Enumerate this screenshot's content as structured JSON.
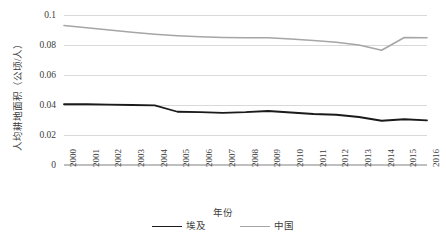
{
  "chart_data": {
    "type": "line",
    "title": "",
    "xlabel": "年份",
    "ylabel": "人均耕地面积（公顷/人）",
    "categories": [
      "2000",
      "2001",
      "2002",
      "2003",
      "2004",
      "2005",
      "2006",
      "2007",
      "2008",
      "2009",
      "2010",
      "2011",
      "2012",
      "2013",
      "2014",
      "2015",
      "2016"
    ],
    "ylim": [
      0,
      0.1
    ],
    "yticks": [
      "0",
      "0.02",
      "0.04",
      "0.06",
      "0.08",
      "0.1"
    ],
    "ytick_values": [
      0,
      0.02,
      0.04,
      0.06,
      0.08,
      0.1
    ],
    "grid": true,
    "legend_position": "bottom",
    "series": [
      {
        "name": "埃及",
        "color": "#1a1a1a",
        "width": 1.8,
        "values": [
          0.0405,
          0.0405,
          0.0402,
          0.04,
          0.0398,
          0.0355,
          0.0352,
          0.0348,
          0.0352,
          0.036,
          0.035,
          0.034,
          0.0335,
          0.032,
          0.0295,
          0.0305,
          0.0298
        ]
      },
      {
        "name": "中国",
        "color": "#a6a6a6",
        "width": 1.6,
        "values": [
          0.093,
          0.0915,
          0.09,
          0.0885,
          0.0872,
          0.0862,
          0.0855,
          0.085,
          0.0848,
          0.0848,
          0.084,
          0.083,
          0.0818,
          0.08,
          0.0765,
          0.085,
          0.0848
        ]
      }
    ]
  }
}
